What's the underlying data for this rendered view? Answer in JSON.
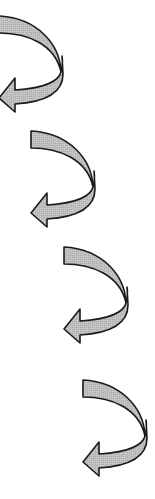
{
  "diagram": {
    "type": "sequence of curved arrows",
    "fill_color": "#b8b8b8",
    "stroke_color": "#1a1a1a",
    "background": "#ffffff",
    "arrows": [
      {
        "icon": "curved-arrow-icon",
        "left": -3,
        "top": 14
      },
      {
        "icon": "curved-arrow-icon",
        "left": 29,
        "top": 129
      },
      {
        "icon": "curved-arrow-icon",
        "left": 62,
        "top": 245
      },
      {
        "icon": "curved-arrow-icon",
        "left": 81,
        "top": 378
      }
    ]
  }
}
